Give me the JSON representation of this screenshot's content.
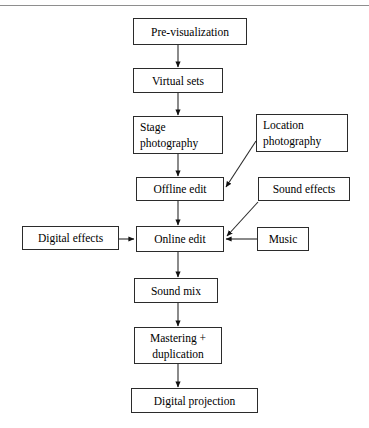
{
  "figure": {
    "type": "flowchart",
    "orientation": "top-to-bottom",
    "background_color": "#ffffff",
    "line_color": "#2b2b2b",
    "rule_color": "#8e8e8e",
    "text_color": "#000000"
  },
  "top_rule": {
    "present": true,
    "label": "horizontal-rule"
  },
  "nodes": [
    {
      "id": "pre-visualization",
      "lines": [
        "Pre-visualization"
      ],
      "align": "center",
      "x": 133,
      "y": 18,
      "w": 114,
      "h": 27
    },
    {
      "id": "virtual-sets",
      "lines": [
        "Virtual sets"
      ],
      "align": "center",
      "x": 133,
      "y": 68,
      "w": 90,
      "h": 25
    },
    {
      "id": "stage-photography",
      "lines": [
        "Stage",
        "photography"
      ],
      "align": "left",
      "x": 133,
      "y": 116,
      "w": 90,
      "h": 38
    },
    {
      "id": "location-photography",
      "lines": [
        "Location",
        "photography"
      ],
      "align": "left",
      "x": 256,
      "y": 114,
      "w": 92,
      "h": 38
    },
    {
      "id": "offline-edit",
      "lines": [
        "Offline edit"
      ],
      "align": "center",
      "x": 136,
      "y": 177,
      "w": 88,
      "h": 24
    },
    {
      "id": "sound-effects",
      "lines": [
        "Sound effects"
      ],
      "align": "center",
      "x": 258,
      "y": 177,
      "w": 92,
      "h": 24
    },
    {
      "id": "digital-effects",
      "lines": [
        "Digital effects"
      ],
      "align": "center",
      "x": 22,
      "y": 226,
      "w": 97,
      "h": 24
    },
    {
      "id": "online-edit",
      "lines": [
        "Online edit"
      ],
      "align": "center",
      "x": 136,
      "y": 226,
      "w": 88,
      "h": 26
    },
    {
      "id": "music",
      "lines": [
        "Music"
      ],
      "align": "center",
      "x": 257,
      "y": 227,
      "w": 52,
      "h": 24
    },
    {
      "id": "sound-mix",
      "lines": [
        "Sound mix"
      ],
      "align": "center",
      "x": 134,
      "y": 278,
      "w": 84,
      "h": 25
    },
    {
      "id": "mastering-duplication",
      "lines": [
        "Mastering +",
        "duplication"
      ],
      "align": "center",
      "x": 134,
      "y": 327,
      "w": 88,
      "h": 37
    },
    {
      "id": "digital-projection",
      "lines": [
        "Digital projection"
      ],
      "align": "center",
      "x": 131,
      "y": 388,
      "w": 127,
      "h": 25
    }
  ],
  "edges": [
    {
      "id": "previs-to-virtualsets",
      "from": "pre-visualization",
      "to": "virtual-sets",
      "style": "vertical"
    },
    {
      "id": "virtualsets-to-stage",
      "from": "virtual-sets",
      "to": "stage-photography",
      "style": "vertical"
    },
    {
      "id": "stage-to-offline",
      "from": "stage-photography",
      "to": "offline-edit",
      "style": "vertical"
    },
    {
      "id": "location-to-offline",
      "from": "location-photography",
      "to": "offline-edit",
      "style": "diagonal"
    },
    {
      "id": "offline-to-online",
      "from": "offline-edit",
      "to": "online-edit",
      "style": "vertical"
    },
    {
      "id": "soundeffects-to-online",
      "from": "sound-effects",
      "to": "online-edit",
      "style": "diagonal"
    },
    {
      "id": "digitaleffects-to-online",
      "from": "digital-effects",
      "to": "online-edit",
      "style": "horizontal"
    },
    {
      "id": "music-to-online",
      "from": "music",
      "to": "online-edit",
      "style": "horizontal"
    },
    {
      "id": "online-to-soundmix",
      "from": "online-edit",
      "to": "sound-mix",
      "style": "vertical"
    },
    {
      "id": "soundmix-to-mastering",
      "from": "sound-mix",
      "to": "mastering-duplication",
      "style": "vertical"
    },
    {
      "id": "mastering-to-projection",
      "from": "mastering-duplication",
      "to": "digital-projection",
      "style": "vertical"
    }
  ]
}
